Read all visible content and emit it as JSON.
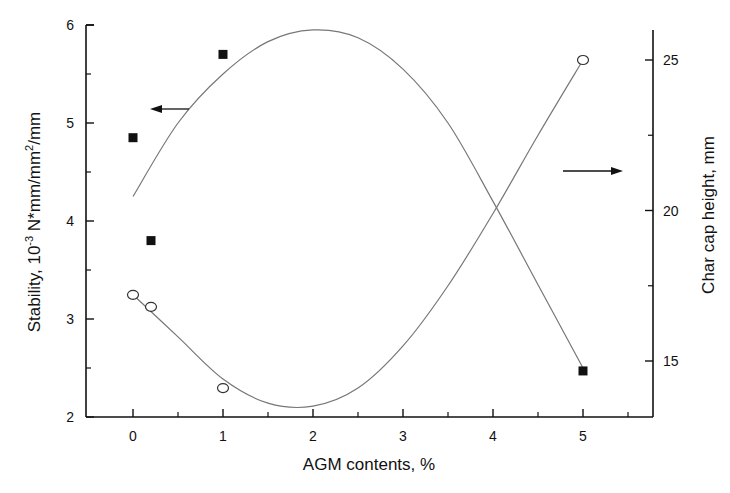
{
  "chart_data": {
    "type": "scatter",
    "title": "",
    "xlabel": "AGM contents, %",
    "ylabel": "Stability, 10^-3 N*mm/mm^2/mm",
    "ylabel_parts": {
      "prefix": "Stability, 10",
      "exp1": "-3",
      "mid": " N*mm/mm",
      "exp2": "2",
      "suffix": "/mm"
    },
    "y2label": "Char cap height, mm",
    "xlim": [
      -0.5,
      5.7
    ],
    "ylim": [
      2,
      6
    ],
    "y2lim": [
      13.0,
      26.2
    ],
    "x_ticks": [
      0,
      1,
      2,
      3,
      4,
      5
    ],
    "x_tick_labels": [
      "0",
      "1",
      "2",
      "3",
      "4",
      "5"
    ],
    "y_ticks": [
      2,
      3,
      4,
      5,
      6
    ],
    "y_tick_labels": [
      "2",
      "3",
      "4",
      "5",
      "6"
    ],
    "y2_ticks": [
      15,
      20,
      25
    ],
    "y2_tick_labels": [
      "15",
      "20",
      "25"
    ],
    "grid": false,
    "legend": "none (arrows indicate axis association)",
    "series": [
      {
        "name": "Stability",
        "axis": "left",
        "marker": "filled-square",
        "x": [
          0,
          0.2,
          1,
          5
        ],
        "y": [
          4.85,
          3.8,
          5.7,
          2.47
        ],
        "fit_curve": {
          "x": [
            0,
            0.5,
            1,
            1.5,
            2,
            2.5,
            3,
            3.5,
            4,
            4.5,
            5
          ],
          "y": [
            4.25,
            5.0,
            5.5,
            5.83,
            5.95,
            5.87,
            5.55,
            5.0,
            4.2,
            3.35,
            2.5
          ]
        }
      },
      {
        "name": "Char cap height",
        "axis": "right",
        "marker": "open-circle",
        "x": [
          0,
          0.2,
          1,
          5
        ],
        "y": [
          17.2,
          16.8,
          14.1,
          25.0
        ],
        "fit_curve": {
          "x": [
            0,
            0.5,
            1,
            1.5,
            2,
            2.5,
            3,
            3.5,
            4,
            4.5,
            5
          ],
          "y": [
            17.2,
            15.8,
            14.4,
            13.6,
            13.5,
            14.1,
            15.5,
            17.5,
            19.9,
            22.5,
            25.0
          ]
        }
      }
    ],
    "annotations": [
      {
        "type": "arrow",
        "direction": "left",
        "points_to": "left axis",
        "series": "Stability"
      },
      {
        "type": "arrow",
        "direction": "right",
        "points_to": "right axis",
        "series": "Char cap height"
      }
    ]
  }
}
